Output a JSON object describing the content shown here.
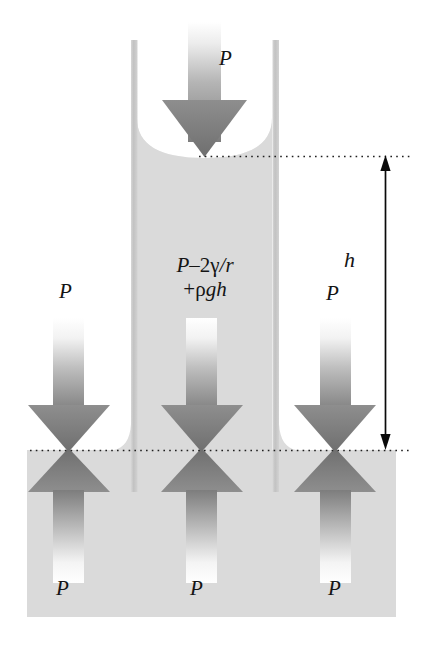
{
  "figure": {
    "type": "physics-diagram",
    "topic": "capillary-rise-pressure-balance",
    "labels": {
      "pressure_top": "P",
      "pressure_left": "P",
      "pressure_right": "P",
      "pressure_bottom_left": "P",
      "pressure_bottom_middle": "P",
      "pressure_bottom_right": "P",
      "height": "h"
    },
    "formula": {
      "line1": {
        "symbol_p": "P",
        "minus": "–",
        "two": "2",
        "gamma": "γ",
        "slash_r": "/r"
      },
      "line2": {
        "plus": "+",
        "rho": "ρ",
        "g": "g",
        "h": "h"
      },
      "plain_text": "P – 2γ/r + ρgh"
    },
    "colors": {
      "liquid": "#d9d9d9",
      "tube_wall": "#c9c9c9",
      "arrow_dark": "#7a7a7a",
      "arrow_light": "#ffffff",
      "dotted_line": "#1a1a1a",
      "dimension_arrow": "#0a0a0a",
      "text": "#141414",
      "background": "#ffffff"
    },
    "geometry": {
      "tube_left_wall_x": 131,
      "tube_right_wall_x": 272,
      "tube_wall_width": 7,
      "tube_top_y": 40,
      "meniscus_bottom_y": 155,
      "reservoir_surface_y": 450,
      "reservoir_left_x": 27,
      "reservoir_right_x": 396,
      "reservoir_bottom_y": 617,
      "height_arrow_x": 385,
      "height_arrow_top_y": 156,
      "height_arrow_bottom_y": 449
    },
    "arrows": {
      "downward_count": 4,
      "upward_count": 3,
      "dimension_double_headed": 1
    }
  }
}
